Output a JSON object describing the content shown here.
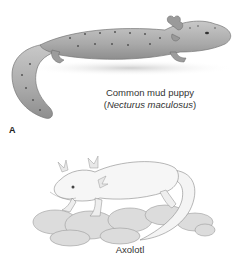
{
  "figure": {
    "panel_label": "A",
    "mudpuppy": {
      "common_name": "Common mud puppy",
      "scientific_open": "(",
      "scientific_name": "Necturus maculosus",
      "scientific_close": ")"
    },
    "axolotl": {
      "common_name": "Axolotl"
    }
  },
  "colors": {
    "background": "#ffffff",
    "mudpuppy_body": "#b3b3b3",
    "mudpuppy_spots": "#555555",
    "axolotl_body": "#f2f2f2",
    "rocks": "#d9d9d9",
    "text": "#333333"
  }
}
